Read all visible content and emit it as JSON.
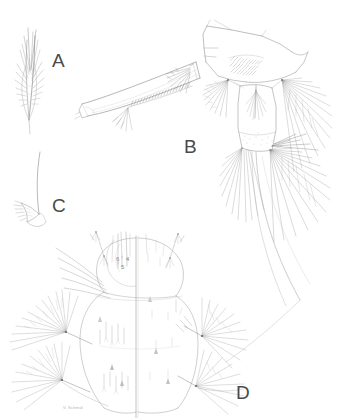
{
  "plate": {
    "background_color": "#ffffff",
    "ink_color": "#6e6e6e",
    "ink_color_dark": "#4a4a4a",
    "ink_color_light": "#a8a8a8",
    "width": 357,
    "height": 418
  },
  "panels": [
    {
      "id": "panel-a",
      "label": "A",
      "label_x": 52,
      "label_y": 51,
      "subject": "plumose-seta",
      "description": "feathered pinnate seta"
    },
    {
      "id": "panel-b",
      "label": "B",
      "label_x": 184,
      "label_y": 137,
      "subject": "siphon-and-anal-segment",
      "description": "siphon with pecten row, comb scales and caudal setal fans"
    },
    {
      "id": "panel-c",
      "label": "C",
      "label_x": 52,
      "label_y": 196,
      "subject": "pecten-tooth",
      "description": "pecten tooth with basal denticles"
    },
    {
      "id": "panel-d",
      "label": "D",
      "label_x": 236,
      "label_y": 383,
      "subject": "thorax-chaetotaxy",
      "description": "thoracic segments with numbered setae and plumose tufts"
    }
  ],
  "seta_numbers": [
    {
      "label": "6",
      "x": 116,
      "y": 256
    },
    {
      "label": "4",
      "x": 126,
      "y": 256
    },
    {
      "label": "5",
      "x": 121,
      "y": 264
    }
  ],
  "credit": {
    "text": "V. Schmid",
    "x": 63,
    "y": 406
  }
}
